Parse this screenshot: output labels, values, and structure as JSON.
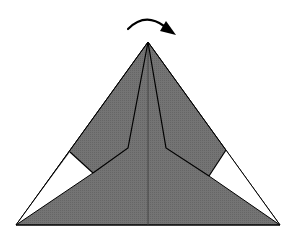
{
  "diagram": {
    "type": "origami-step",
    "colors": {
      "background": "#ffffff",
      "paper_fill": "#6f6f6f",
      "paper_back": "#ffffff",
      "outline": "#000000",
      "centerline": "#3a3a3a"
    },
    "arrow": {
      "label": "turn-over-arrow",
      "path": "M128,29 Q145,12 164,26",
      "head": "176,35 160,31 166,21"
    },
    "shapes": {
      "outer_triangle": "148,42 16,225 280,225",
      "left_white": "70,152 93,173 16,225",
      "right_white": "226,150 209,176 280,225",
      "left_flap_bottom": "70,152 93,173",
      "right_flap_bottom": "226,150 209,176",
      "left_crease": "148,42 128,148 93,173",
      "right_crease": "148,42 166,148 209,176",
      "lower_left_edge": "93,173 16,225",
      "lower_right_edge": "209,176 280,225",
      "centerline": {
        "x1": 148,
        "y1": 42,
        "x2": 148,
        "y2": 225
      }
    }
  }
}
